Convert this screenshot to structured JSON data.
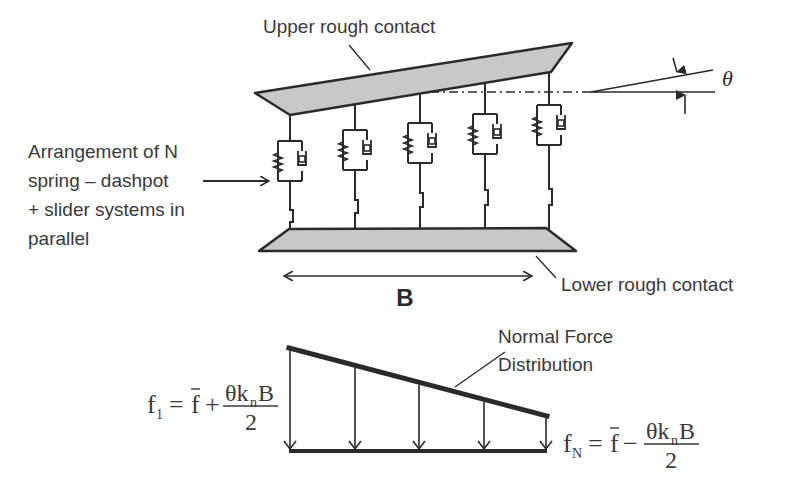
{
  "labels": {
    "upper_contact": "Upper rough contact",
    "lower_contact": "Lower rough contact",
    "arrangement": [
      "Arrangement of N",
      "spring – dashpot",
      "+ slider systems in",
      "parallel"
    ],
    "width_label": "B",
    "angle_label": "θ",
    "force_distribution": [
      "Normal Force",
      "Distribution"
    ]
  },
  "equations": {
    "f1": {
      "lhs": "f",
      "lhs_sub": "1",
      "eq": "=",
      "fbar": "f",
      "op": "+",
      "numerator_theta": "θk",
      "numerator_sub": "n",
      "numerator_B": "B",
      "denominator": "2"
    },
    "fN": {
      "lhs": "f",
      "lhs_sub": "N",
      "eq": "=",
      "fbar": "f",
      "op": "−",
      "numerator_theta": "θk",
      "numerator_sub": "n",
      "numerator_B": "B",
      "denominator": "2"
    }
  },
  "model": {
    "element_count": 5,
    "element_type": "spring-dashpot + slider",
    "colors": {
      "plate_fill": "#c8c8c8",
      "stroke": "#2a2a2a",
      "text": "#3a3a3a"
    }
  }
}
